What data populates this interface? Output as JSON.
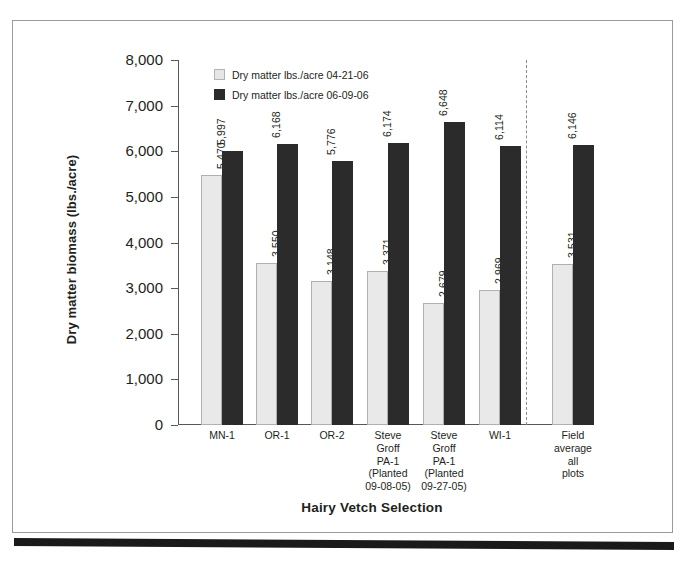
{
  "figure": {
    "top_caption_remnant": "",
    "frame_color": "#9a9a9a",
    "rule_color": "#1a1a1a"
  },
  "chart_data": {
    "type": "bar",
    "title": "",
    "xlabel": "Hairy Vetch Selection",
    "ylabel": "Dry matter biomass (lbs./acre)",
    "ylim": [
      0,
      8000
    ],
    "ytick_labels": [
      "8,000",
      "7,000",
      "6,000",
      "5,000",
      "4,000",
      "3,000",
      "2,000",
      "1,000",
      "0"
    ],
    "ytick_values": [
      8000,
      7000,
      6000,
      5000,
      4000,
      3000,
      2000,
      1000,
      0
    ],
    "grid": false,
    "legend_position": "upper-left-inside",
    "categories": [
      "MN-1",
      "OR-1",
      "OR-2",
      "Steve Groff PA-1 (Planted 09-08-05)",
      "Steve Groff PA-1 (Planted 09-27-05)",
      "WI-1",
      "Field average all plots"
    ],
    "category_label_lines": [
      [
        "MN-1"
      ],
      [
        "OR-1"
      ],
      [
        "OR-2"
      ],
      [
        "Steve",
        "Groff",
        "PA-1",
        "(Planted",
        "09-08-05)"
      ],
      [
        "Steve",
        "Groff",
        "PA-1",
        "(Planted",
        "09-27-05)"
      ],
      [
        "WI-1"
      ],
      [
        "Field",
        "average",
        "all",
        "plots"
      ]
    ],
    "series": [
      {
        "name": "Dry matter lbs./acre 04-21-06",
        "color": "#e9e9e9",
        "values": [
          5470,
          3550,
          3148,
          3371,
          2679,
          2969,
          3531
        ],
        "value_labels": [
          "5,470",
          "3,550",
          "3,148",
          "3,371",
          "2,679",
          "2,969",
          "3,531"
        ]
      },
      {
        "name": "Dry matter lbs./acre 06-09-06",
        "color": "#2b2b2b",
        "values": [
          5997,
          6168,
          5776,
          6174,
          6648,
          6114,
          6146
        ],
        "value_labels": [
          "5,997",
          "6,168",
          "5,776",
          "6,174",
          "6,648",
          "6,114",
          "6,146"
        ]
      }
    ],
    "separator": {
      "after_category_index": 5,
      "style": "dotted",
      "note": "separates individual selections from field average"
    }
  }
}
